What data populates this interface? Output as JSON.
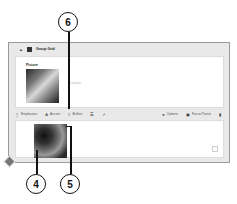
{
  "block": {
    "title": "Group Grid",
    "grid_icon": "grid-icon",
    "collapse_icon": "caret-up-icon"
  },
  "card1": {
    "label": "Picture",
    "caption_placeholder": "Caption"
  },
  "toolbar": {
    "items": [
      {
        "icon": "emphasize-icon",
        "label": "Emphasize"
      },
      {
        "icon": "accent-icon",
        "label": "Accent"
      },
      {
        "icon": "bullets-icon",
        "label": "Bullets"
      },
      {
        "icon": "list-icon",
        "label": ""
      },
      {
        "icon": "link-icon",
        "label": ""
      }
    ],
    "right_items": [
      {
        "icon": "options-icon",
        "label": "Options"
      },
      {
        "icon": "focus-points-icon",
        "label": "Focus Points"
      },
      {
        "icon": "trash-icon",
        "label": ""
      }
    ]
  },
  "callouts": {
    "c4": "4",
    "c5": "5",
    "c6": "6"
  }
}
